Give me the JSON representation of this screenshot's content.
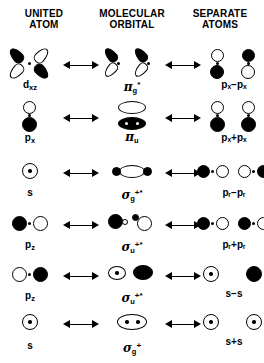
{
  "headers": [
    {
      "line1": "UNITED",
      "line2": "ATOM"
    },
    {
      "line1": "MOLECULAR",
      "line2": "ORBITAL"
    },
    {
      "line1": "SEPARATE",
      "line2": "ATOMS"
    }
  ],
  "arrow": {
    "name": "double-headed-arrow",
    "glyph": "⟷"
  },
  "rows": [
    {
      "id": "row-1",
      "united": {
        "base": "d",
        "sub": "xz",
        "sup": ""
      },
      "molecular": {
        "base": "π",
        "sub": "g",
        "sup": "*"
      },
      "separate": {
        "text": "pₓ−pₓ",
        "base": "p",
        "sub": "x",
        "op": "−"
      }
    },
    {
      "id": "row-2",
      "united": {
        "base": "p",
        "sub": "x",
        "sup": ""
      },
      "molecular": {
        "base": "π",
        "sub": "u",
        "sup": ""
      },
      "separate": {
        "text": "pₓ+pₓ",
        "base": "p",
        "sub": "x",
        "op": "+"
      }
    },
    {
      "id": "row-3",
      "united": {
        "base": "s",
        "sub": "",
        "sup": ""
      },
      "molecular": {
        "base": "σ",
        "sub": "g",
        "sup": "+*"
      },
      "separate": {
        "text": "pᵣ−pᵣ",
        "base": "p",
        "sub": "z",
        "op": "−"
      }
    },
    {
      "id": "row-4",
      "united": {
        "base": "p",
        "sub": "z",
        "sup": ""
      },
      "molecular": {
        "base": "σ",
        "sub": "u",
        "sup": "+*"
      },
      "separate": {
        "text": "pᵣ+pᵣ",
        "base": "p",
        "sub": "z",
        "op": "+"
      }
    },
    {
      "id": "row-5",
      "united": {
        "base": "p",
        "sub": "z",
        "sup": ""
      },
      "molecular": {
        "base": "σ",
        "sub": "u",
        "sup": "+*"
      },
      "separate": {
        "text": "s−s",
        "base": "s",
        "sub": "",
        "op": "−"
      }
    },
    {
      "id": "row-6",
      "united": {
        "base": "s",
        "sub": "",
        "sup": ""
      },
      "molecular": {
        "base": "σ",
        "sub": "g",
        "sup": "+"
      },
      "separate": {
        "text": "s+s",
        "base": "s",
        "sub": "",
        "op": "+"
      }
    }
  ],
  "colors": {
    "ink": "#000000",
    "paper": "#ffffff",
    "lobe_filled": "#000000",
    "lobe_open": "#ffffff"
  }
}
